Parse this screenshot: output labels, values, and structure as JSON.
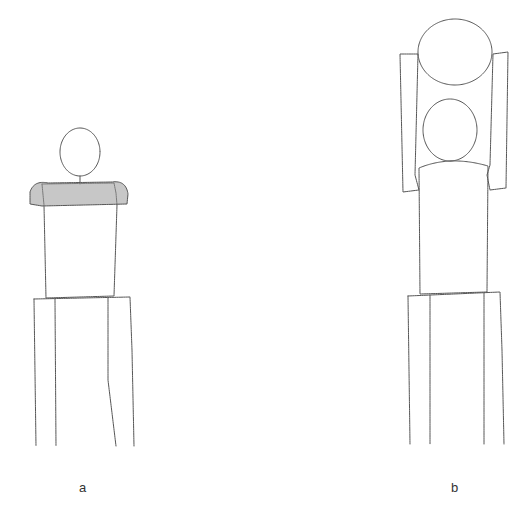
{
  "figure": {
    "panels": [
      {
        "label": "a",
        "description": "figure with head, shoulder bar, body on legs"
      },
      {
        "label": "b",
        "description": "figure with two heads and side arms on legs"
      }
    ],
    "stroke_color": "#555555",
    "shade_color": "#888888"
  }
}
